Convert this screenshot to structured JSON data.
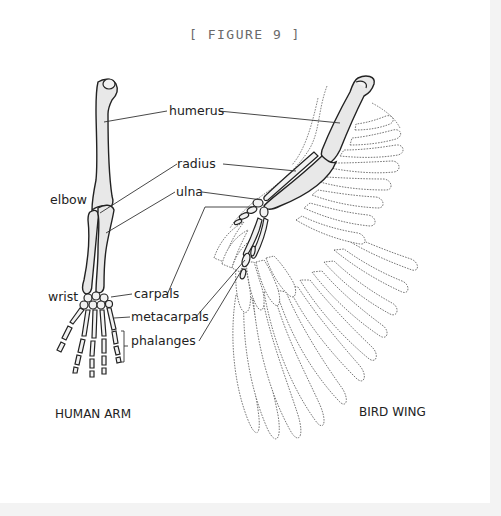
{
  "figure": {
    "title": "[ FIGURE 9 ]"
  },
  "labels": {
    "humerus": "humerus",
    "radius": "radius",
    "ulna": "ulna",
    "elbow": "elbow",
    "wrist": "wrist",
    "carpals": "carpals",
    "metacarpals": "metacarpals",
    "phalanges": "phalanges"
  },
  "captions": {
    "human": "HUMAN ARM",
    "bird": "BIRD WING"
  },
  "colors": {
    "bone_fill": "#e8e8e8",
    "line": "#222222",
    "feather_outline": "#555555",
    "title": "#6a6a6a"
  }
}
